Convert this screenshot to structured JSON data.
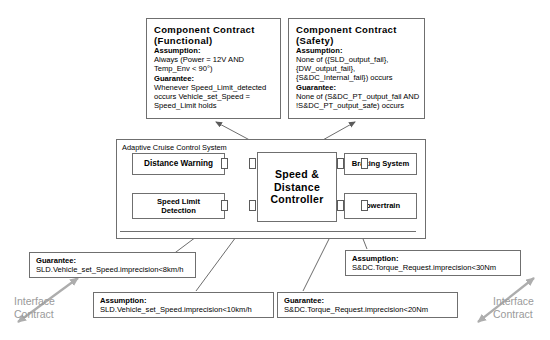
{
  "contracts": [
    {
      "id": "functional",
      "title": "Component Contract",
      "subtitle": "(Functional)",
      "assumption_head": "Assumption:",
      "assumption_lines": [
        "Always (Power = 12V AND",
        "Temp_Env < 90°)"
      ],
      "guarantee_head": "Guarantee:",
      "guarantee_lines": [
        "Whenever Speed_Limit_detected",
        "occurs Vehicle_set_Speed =",
        "Speed_Limit holds"
      ]
    },
    {
      "id": "safety",
      "title": "Component Contract",
      "subtitle": "(Safety)",
      "assumption_head": "Assumption:",
      "assumption_lines": [
        "None of ({SLD_output_fail},",
        "{DW_output_fail},",
        "{S&DC_Internal_fail}) occurs"
      ],
      "guarantee_head": "Guarantee:",
      "guarantee_lines": [
        "None of (S&DC_PT_output_fail AND",
        "!S&DC_PT_output_safe) occurs"
      ]
    }
  ],
  "system": {
    "frame_label": "Adaptive Cruise Control System",
    "blocks": {
      "distance_warning": "Distance Warning",
      "speed_limit_detection_l1": "Speed Limit",
      "speed_limit_detection_l2": "Detection",
      "controller_l1": "Speed &",
      "controller_l2": "Distance",
      "controller_l3": "Controller",
      "braking_system": "Braking System",
      "powertrain": "Powertrain"
    }
  },
  "callouts": [
    {
      "id": "guarantee-sld",
      "head": "Guarantee:",
      "line": "SLD.Vehicle_set_Speed.imprecision<8km/h"
    },
    {
      "id": "assumption-sld",
      "head": "Assumption:",
      "line": "SLD.Vehicle_set_Speed.imprecision<10km/h"
    },
    {
      "id": "guarantee-sdc",
      "head": "Guarantee:",
      "line": "S&DC.Torque_Request.imprecision<20Nm"
    },
    {
      "id": "assumption-sdc",
      "head": "Assumption:",
      "line": "S&DC.Torque_Request.imprecision<30Nm"
    }
  ],
  "interface_contract": {
    "line1": "Interface",
    "line2": "Contract"
  },
  "colors": {
    "stroke": "#6f6f6f",
    "text": "#000000",
    "muted": "#9a9a9a",
    "background": "#ffffff"
  }
}
